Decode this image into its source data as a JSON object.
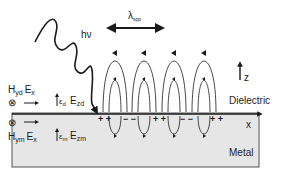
{
  "diagram": {
    "photon": {
      "label": "hν"
    },
    "wavelength": {
      "symbol": "λ",
      "subscript": "spp"
    },
    "axes": {
      "z": "z",
      "x": "x"
    },
    "regions": {
      "dielectric": "Dielectric",
      "metal": "Metal"
    },
    "dielectric_fields": {
      "H": "H",
      "H_sub": "yd",
      "Ex": "E",
      "Ex_sub": "x",
      "eps": "ε",
      "eps_sub": "d",
      "Ez": "E",
      "Ez_sub": "zd",
      "out_of_plane_symbol": "⊗",
      "arrow_symbol": "→"
    },
    "metal_fields": {
      "H": "H",
      "H_sub": "ym",
      "Ex": "E",
      "Ex_sub": "x",
      "eps": "ε",
      "eps_sub": "m",
      "Ez": "E",
      "Ez_sub": "zm",
      "out_of_plane_symbol": "⊗",
      "arrow_symbol": "→"
    },
    "surface_charges": [
      "+ +",
      "− −",
      "+ +",
      "− −",
      "+ +"
    ],
    "colors": {
      "metal_fill": "#e6e6e6",
      "stroke": "#1a1a1a",
      "field_line": "#333333"
    }
  }
}
